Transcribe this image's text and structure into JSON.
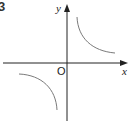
{
  "question_number": "3",
  "axes": {
    "x_label": "x",
    "y_label": "y",
    "origin_label": "O"
  },
  "curves": [
    {
      "name": "hyperbola-branch-quadrant-1",
      "quadrant": 1
    },
    {
      "name": "hyperbola-branch-quadrant-3",
      "quadrant": 3
    }
  ],
  "colors": {
    "axis": "#222222",
    "curve": "#7a7a7a"
  }
}
